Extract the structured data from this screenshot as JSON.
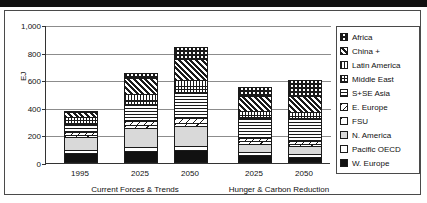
{
  "chart_data": {
    "type": "bar",
    "subtype": "stacked-bar-grouped",
    "title": "",
    "xlabel": "",
    "ylabel": "EJ",
    "ylim": [
      0,
      1000
    ],
    "yticks": [
      "0",
      "200",
      "400",
      "600",
      "800",
      "1,000"
    ],
    "ytick_values": [
      0,
      200,
      400,
      600,
      800,
      1000
    ],
    "grid": true,
    "legend_position": "right",
    "categories": [
      "1995",
      "2025",
      "2050",
      "2025",
      "2050"
    ],
    "groups": [
      {
        "label": "Current Forces & Trends",
        "categories": [
          "1995",
          "2025",
          "2050"
        ]
      },
      {
        "label": "Hunger & Carbon Reduction",
        "categories": [
          "2025",
          "2050"
        ]
      }
    ],
    "series": [
      {
        "name": "W. Europe",
        "pattern": "solid-black",
        "values": [
          60,
          75,
          78,
          48,
          30
        ]
      },
      {
        "name": "Pacific OECD",
        "pattern": "white",
        "values": [
          22,
          25,
          30,
          18,
          20
        ]
      },
      {
        "name": "N. America",
        "pattern": "light-gray",
        "values": [
          96,
          145,
          150,
          62,
          60
        ]
      },
      {
        "name": "FSU",
        "pattern": "wide-diagonal",
        "values": [
          18,
          20,
          22,
          18,
          18
        ]
      },
      {
        "name": "E. Europe",
        "pattern": "narrow-diagonal",
        "values": [
          22,
          35,
          40,
          22,
          22
        ]
      },
      {
        "name": "S+SE Asia",
        "pattern": "horizontal-lines",
        "values": [
          60,
          115,
          180,
          150,
          160
        ]
      },
      {
        "name": "Middle East",
        "pattern": "fine-grid",
        "values": [
          30,
          40,
          50,
          25,
          25
        ]
      },
      {
        "name": "Latin America",
        "pattern": "vertical-lines",
        "values": [
          24,
          40,
          50,
          30,
          30
        ]
      },
      {
        "name": "China +",
        "pattern": "bold-diagonal",
        "values": [
          36,
          120,
          155,
          110,
          120
        ]
      },
      {
        "name": "Africa",
        "pattern": "checkerboard",
        "values": [
          12,
          40,
          85,
          70,
          115
        ]
      }
    ],
    "totals": [
      380,
      655,
      840,
      553,
      600
    ]
  },
  "legend": {
    "items": [
      {
        "label": "Africa",
        "swatch": "checkerboard-swatch"
      },
      {
        "label": "China +",
        "swatch": "bold-diagonal-swatch"
      },
      {
        "label": "Latin America",
        "swatch": "vertical-lines-swatch"
      },
      {
        "label": "Middle East",
        "swatch": "fine-grid-swatch"
      },
      {
        "label": "S+SE Asia",
        "swatch": "horizontal-lines-swatch"
      },
      {
        "label": "E. Europe",
        "swatch": "narrow-diagonal-swatch"
      },
      {
        "label": "FSU",
        "swatch": "wide-diagonal-swatch"
      },
      {
        "label": "N. America",
        "swatch": "light-gray-swatch"
      },
      {
        "label": "Pacific OECD",
        "swatch": "white-swatch"
      },
      {
        "label": "W. Europe",
        "swatch": "solid-black-swatch"
      }
    ]
  },
  "colors": {
    "ink": "#111111",
    "gridline": "#8c8c8c",
    "frame": "#4a4a4a",
    "gray_fill": "#d9d9d9",
    "background": "#ffffff"
  }
}
